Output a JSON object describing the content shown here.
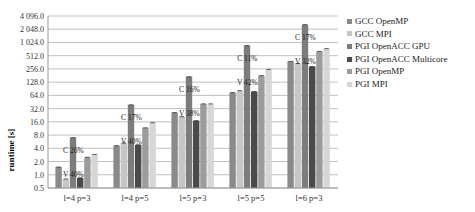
{
  "chart_data": {
    "type": "bar",
    "title": "",
    "xlabel": "",
    "ylabel": "runtime [s]",
    "yscale": "log2",
    "ylim": [
      0.5,
      4096
    ],
    "grid": true,
    "legend_position": "right",
    "y_ticks": [
      "0.5",
      "1.0",
      "2.0",
      "4.0",
      "8.0",
      "16.0",
      "32.0",
      "64.0",
      "128.0",
      "256.0",
      "512.0",
      "1 024.0",
      "2 048.0",
      "4 096.0"
    ],
    "y_tick_values": [
      0.5,
      1,
      2,
      4,
      8,
      16,
      32,
      64,
      128,
      256,
      512,
      1024,
      2048,
      4096
    ],
    "categories": [
      "l=4 p=3",
      "l=4 p=5",
      "l=5 p=3",
      "l=5 p=5",
      "l=6 p=3"
    ],
    "series": [
      {
        "name": "GCC OpenMP",
        "color": "#8a8a8a",
        "values": [
          1.5,
          4.6,
          26,
          74,
          380
        ]
      },
      {
        "name": "GCC MPI",
        "color": "#c6c6c6",
        "values": [
          0.8,
          5.3,
          21,
          82,
          340
        ]
      },
      {
        "name": "PGI OpenACC GPU",
        "color": "#7c7c7c",
        "values": [
          7,
          39,
          170,
          870,
          2600
        ]
      },
      {
        "name": "PGI OpenACC Multicore",
        "color": "#4a4a4a",
        "values": [
          0.85,
          4.8,
          17,
          78,
          290
        ]
      },
      {
        "name": "PGI OpenMP",
        "color": "#9c9c9c",
        "values": [
          2.5,
          11.7,
          41,
          180,
          640
        ]
      },
      {
        "name": "PGI MPI",
        "color": "#d6d6d6",
        "values": [
          2.9,
          15.3,
          41,
          250,
          740
        ]
      }
    ],
    "annotations": [
      {
        "category": "l=4 p=3",
        "c_label": "C 26%",
        "v_label": "V 40%"
      },
      {
        "category": "l=4 p=5",
        "c_label": "C 17%",
        "v_label": "V 40%"
      },
      {
        "category": "l=5 p=3",
        "c_label": "C 16%",
        "v_label": "V 38%"
      },
      {
        "category": "l=5 p=5",
        "c_label": "C 11%",
        "v_label": "V 42%"
      },
      {
        "category": "l=6 p=3",
        "c_label": "C 17%",
        "v_label": "V 32%"
      }
    ]
  }
}
